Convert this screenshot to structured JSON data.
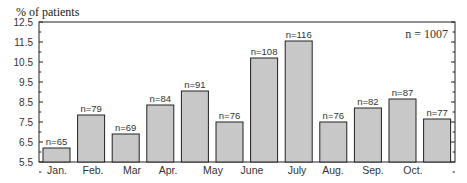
{
  "chart_data": {
    "type": "bar",
    "title": "",
    "ylabel": "% of patients",
    "xlabel": "",
    "ylim": [
      5.5,
      12.5
    ],
    "yticks": [
      "5.5",
      "6.5",
      "7.5",
      "8.5",
      "9.5",
      "10.5",
      "11.5",
      "12.5"
    ],
    "annotation": "n = 1007",
    "grid": false,
    "bar_color": "#c8c8c8",
    "x_tick_labels": [
      "Jan.",
      "Feb.",
      "Mar",
      "Apr.",
      "May",
      "June",
      "July",
      "Aug.",
      "Sep.",
      "Oct."
    ],
    "bars": [
      {
        "n_label": "n=65",
        "value": 6.2
      },
      {
        "n_label": "n=79",
        "value": 7.85
      },
      {
        "n_label": "n=69",
        "value": 6.9
      },
      {
        "n_label": "n=84",
        "value": 8.35
      },
      {
        "n_label": "n=91",
        "value": 9.05
      },
      {
        "n_label": "n=76",
        "value": 7.5
      },
      {
        "n_label": "n=108",
        "value": 10.7
      },
      {
        "n_label": "n=116",
        "value": 11.55
      },
      {
        "n_label": "n=76",
        "value": 7.5
      },
      {
        "n_label": "n=82",
        "value": 8.2
      },
      {
        "n_label": "n=87",
        "value": 8.65
      },
      {
        "n_label": "n=77",
        "value": 7.65
      }
    ]
  }
}
